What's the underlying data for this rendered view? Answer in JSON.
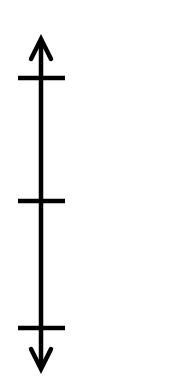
{
  "diagram": {
    "type": "vertical-number-line",
    "orientation": "vertical",
    "arrows": [
      "top",
      "bottom"
    ],
    "tick_count": 3,
    "ticks": [
      {
        "index": 0,
        "label": "",
        "y": 78
      },
      {
        "index": 1,
        "label": "",
        "y": 201
      },
      {
        "index": 2,
        "label": "",
        "y": 328
      }
    ],
    "line": {
      "x": 41,
      "y_top": 38,
      "y_bottom": 368
    },
    "colors": {
      "line": "#000000",
      "background": "#ffffff"
    }
  }
}
